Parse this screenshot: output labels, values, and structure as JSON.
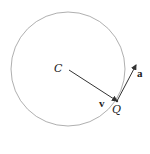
{
  "diagram": {
    "title": "",
    "labels": {
      "center": "C",
      "point": "Q",
      "label_near_CQ_line": "v",
      "label_near_tangent_arrow": "a"
    },
    "label_placement_note": "In the image, 'v' is placed near the C–Q segment and 'a' near the tangent arrow — reversed from the usual convention (v tangent, a centripetal). Rendered as shown.",
    "colors": {
      "circle": "#9a9a9a",
      "vectors": "#333333",
      "text": "#222222"
    },
    "geometry": {
      "circle_center": [
        68,
        69
      ],
      "circle_radius": 56,
      "point_Q": [
        117,
        101
      ]
    }
  }
}
